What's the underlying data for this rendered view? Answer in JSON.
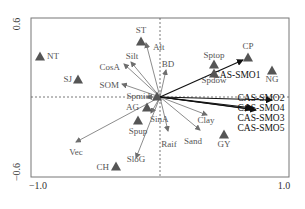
{
  "chart_data": {
    "type": "scatter",
    "subtype": "ordination-biplot",
    "title": "",
    "xlabel": "",
    "ylabel": "",
    "xlim": [
      -1.0,
      1.0
    ],
    "ylim": [
      -0.6,
      0.6
    ],
    "x_ticks": [
      "-1.0",
      "1.0"
    ],
    "y_ticks": [
      "0.6",
      "-0.6"
    ],
    "grid": false,
    "reference_lines": "dashed lines at x=0 and y=0",
    "frame": {
      "left": 31,
      "top": 18,
      "right": 289,
      "bottom": 177,
      "origin_x": 160,
      "origin_y": 97
    },
    "sites": [
      {
        "label": "NT",
        "x": -0.91,
        "y": 0.4,
        "px": 40,
        "py": 56,
        "lx": 47,
        "ly": 59,
        "anchor": "start"
      },
      {
        "label": "SJ",
        "x": -0.59,
        "y": 0.24,
        "px": 78,
        "py": 79,
        "lx": 72,
        "ly": 82,
        "anchor": "end"
      },
      {
        "label": "ST",
        "x": -0.15,
        "y": 0.46,
        "px": 141,
        "py": 41,
        "lx": 141,
        "ly": 33,
        "anchor": "middle"
      },
      {
        "label": "Sptop",
        "x": 0.42,
        "y": 0.24,
        "px": 214,
        "py": 64,
        "lx": 214,
        "ly": 58,
        "anchor": "middle"
      },
      {
        "label": "Spdow",
        "x": 0.42,
        "y": 0.16,
        "px": 214,
        "py": 73,
        "lx": 214,
        "ly": 83,
        "anchor": "middle"
      },
      {
        "label": "CP",
        "x": 0.68,
        "y": 0.42,
        "px": 248,
        "py": 57,
        "lx": 248,
        "ly": 49,
        "anchor": "middle"
      },
      {
        "label": "NG",
        "x": 0.88,
        "y": 0.22,
        "px": 272,
        "py": 70,
        "lx": 272,
        "ly": 82,
        "anchor": "middle"
      },
      {
        "label": "Spmid",
        "x": -0.02,
        "y": 0.0,
        "px": 157,
        "py": 96,
        "lx": 150,
        "ly": 99,
        "anchor": "end"
      },
      {
        "label": "AG",
        "x": -0.08,
        "y": -0.12,
        "px": 147,
        "py": 107,
        "lx": 139,
        "ly": 110,
        "anchor": "end"
      },
      {
        "label": "Spup",
        "x": -0.22,
        "y": -0.24,
        "px": 138,
        "py": 120,
        "lx": 138,
        "ly": 134,
        "anchor": "middle"
      },
      {
        "label": "CH",
        "x": -0.46,
        "y": -0.6,
        "px": 116,
        "py": 166,
        "lx": 109,
        "ly": 170,
        "anchor": "end"
      },
      {
        "label": "GY",
        "x": 0.42,
        "y": -0.4,
        "px": 224,
        "py": 134,
        "lx": 224,
        "ly": 147,
        "anchor": "middle"
      }
    ],
    "env_arrows": [
      {
        "label": "Alt",
        "x2": -0.12,
        "y2": 0.44,
        "tx": 146,
        "ty": 43,
        "lx": 153,
        "ly": 50,
        "anchor": "start"
      },
      {
        "label": "Silt",
        "x2": -0.3,
        "y2": 0.4,
        "tx": 131,
        "ty": 62,
        "lx": 132,
        "ly": 59,
        "anchor": "middle"
      },
      {
        "label": "CosA",
        "x2": -0.3,
        "y2": 0.37,
        "tx": 124,
        "ty": 64,
        "lx": 120,
        "ly": 70,
        "anchor": "end"
      },
      {
        "label": "SOM",
        "x2": -0.3,
        "y2": 0.2,
        "tx": 122,
        "ty": 84,
        "lx": 119,
        "ly": 88,
        "anchor": "end"
      },
      {
        "label": "BD",
        "x2": 0.1,
        "y2": 0.28,
        "tx": 166,
        "ty": 70,
        "lx": 168,
        "ly": 67,
        "anchor": "middle"
      },
      {
        "label": "Clay",
        "x2": 0.44,
        "y2": -0.15,
        "tx": 207,
        "ty": 115,
        "lx": 206,
        "ly": 123,
        "anchor": "middle"
      },
      {
        "label": "Sand",
        "x2": 0.32,
        "y2": -0.3,
        "tx": 200,
        "ty": 130,
        "lx": 193,
        "ly": 144,
        "anchor": "middle"
      },
      {
        "label": "Raif",
        "x2": 0.07,
        "y2": -0.34,
        "tx": 168,
        "ty": 131,
        "lx": 169,
        "ly": 147,
        "anchor": "middle"
      },
      {
        "label": "SinA",
        "x2": -0.04,
        "y2": -0.26,
        "tx": 151,
        "ty": 113,
        "lx": 150,
        "ly": 122,
        "anchor": "start"
      },
      {
        "label": "SloG",
        "x2": -0.3,
        "y2": -0.52,
        "tx": 136,
        "ty": 158,
        "lx": 136,
        "ly": 162,
        "anchor": "middle"
      },
      {
        "label": "Vec",
        "x2": -0.72,
        "y2": -0.44,
        "tx": 76,
        "ty": 142,
        "lx": 76,
        "ly": 155,
        "anchor": "middle"
      },
      {
        "label": "Spmid",
        "x2": -0.1,
        "y2": 0.0,
        "tx": 147,
        "ty": 97,
        "lx": 0,
        "ly": 0,
        "anchor": "none"
      }
    ],
    "response_arrows": [
      {
        "label": "CAS-SMO1",
        "x2": 0.64,
        "y2": 0.37,
        "tx": 243,
        "ty": 60,
        "lx": 237,
        "ly": 78,
        "anchor": "middle"
      },
      {
        "label": "CAS-SMO2",
        "x2": 0.86,
        "y2": -0.04,
        "tx": 272,
        "ty": 100,
        "lx": 261,
        "ly": 101,
        "anchor": "middle"
      },
      {
        "label": "CAS-SMO4",
        "x2": 0.7,
        "y2": -0.11,
        "tx": 251,
        "ty": 109,
        "lx": 261,
        "ly": 111,
        "anchor": "middle"
      },
      {
        "label": "CAS-SMO3",
        "x2": 0.74,
        "y2": -0.12,
        "tx": 256,
        "ty": 110,
        "lx": 261,
        "ly": 121,
        "anchor": "middle"
      },
      {
        "label": "CAS-SMO5",
        "x2": 0.72,
        "y2": -0.1,
        "tx": 253,
        "ty": 108,
        "lx": 261,
        "ly": 131,
        "anchor": "middle"
      }
    ]
  },
  "axes": {
    "y_top_label": "0.6",
    "y_bottom_label": "−0.6",
    "x_left_label": "−1.0",
    "x_right_label": "1.0"
  },
  "colors": {
    "frame": "#777777",
    "dashed": "#555555",
    "env_arrow": "#6e6e6e",
    "response_arrow": "#111111",
    "site_marker": "#555555",
    "env_label": "#555555",
    "response_label": "#111111",
    "tick_label": "#333333"
  }
}
